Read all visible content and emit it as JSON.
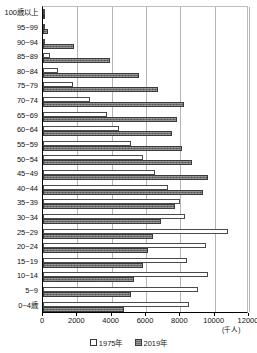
{
  "chart_data": {
    "type": "bar",
    "orientation": "horizontal",
    "title": "",
    "xlabel": "",
    "ylabel": "",
    "unit_note": "(千人)",
    "xlim": [
      0,
      12000
    ],
    "xticks": [
      0,
      2000,
      4000,
      6000,
      8000,
      10000,
      12000
    ],
    "xtick_labels": [
      "0",
      "2000",
      "4000",
      "6000",
      "8000",
      "10000",
      "12000"
    ],
    "grid": true,
    "legend_position": "bottom",
    "categories": [
      "100歳以上",
      "95~99",
      "90~94",
      "85~89",
      "80~84",
      "75~79",
      "70~74",
      "65~69",
      "60~64",
      "55~59",
      "50~54",
      "45~49",
      "40~44",
      "35~39",
      "30~34",
      "25~29",
      "20~24",
      "15~19",
      "10~14",
      "5~9",
      "0~4歳"
    ],
    "series": [
      {
        "name": "1975年",
        "color": "#ffffff",
        "values": [
          10,
          40,
          130,
          400,
          900,
          1750,
          2750,
          3700,
          4400,
          5100,
          5800,
          6500,
          7300,
          8000,
          8300,
          10800,
          9500,
          8400,
          9600,
          9000,
          8500
        ]
      },
      {
        "name": "2019年",
        "color": "#6e6e6e",
        "values": [
          70,
          300,
          1800,
          3900,
          5600,
          6700,
          8200,
          7800,
          7500,
          8100,
          8700,
          9600,
          9300,
          7700,
          6900,
          6400,
          6100,
          5800,
          5300,
          5100,
          4700
        ]
      }
    ]
  },
  "legend": {
    "items": [
      {
        "label": "1975年",
        "marker": "hollow-square"
      },
      {
        "label": "2019年",
        "marker": "filled-square"
      }
    ]
  }
}
